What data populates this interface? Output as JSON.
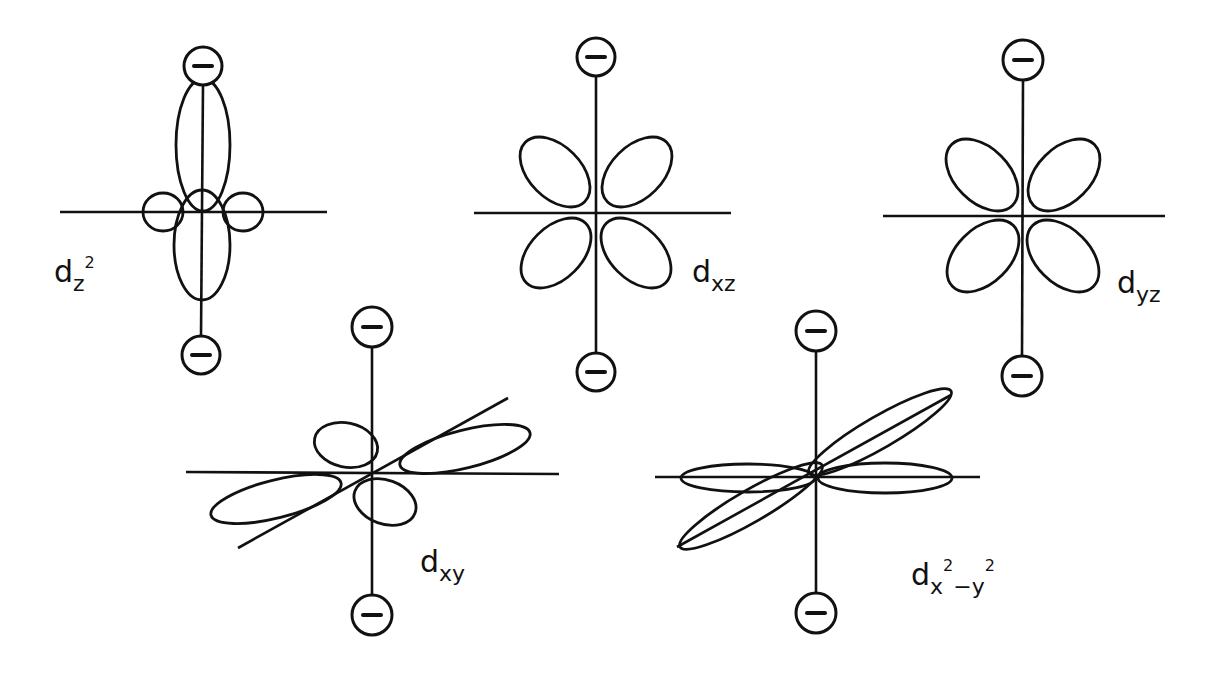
{
  "figure": {
    "ligand_symbol": "−",
    "orbitals": [
      {
        "id": "dz2",
        "letter": "d",
        "subscript": "z",
        "superscript": "2",
        "label_text": "dz²"
      },
      {
        "id": "dxz",
        "letter": "d",
        "subscript": "xz",
        "label_text": "dxz"
      },
      {
        "id": "dyz",
        "letter": "d",
        "subscript": "yz",
        "label_text": "dyz"
      },
      {
        "id": "dxy",
        "letter": "d",
        "subscript": "xy",
        "label_text": "dxy"
      },
      {
        "id": "dx2-y2",
        "letter": "d",
        "subscript_parts": [
          "x",
          "2",
          "−y",
          "2"
        ],
        "label_text": "dx²−y²"
      }
    ]
  }
}
